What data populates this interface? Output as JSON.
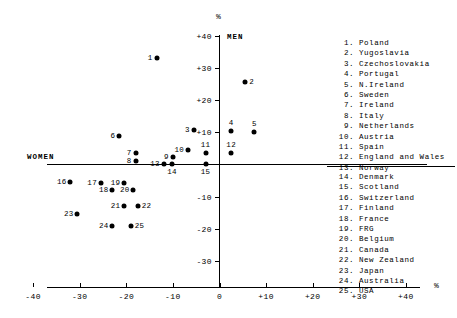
{
  "chart_data": {
    "type": "scatter",
    "title": "",
    "xlabel": "%",
    "ylabel": "%",
    "x_axis_label_right": "%",
    "y_axis_label_top": "%",
    "xlim": [
      -40,
      40
    ],
    "ylim": [
      -40,
      40
    ],
    "xticks": [
      "-40",
      "-30",
      "-20",
      "-10",
      "0",
      "+10",
      "+20",
      "+30",
      "+40"
    ],
    "xtick_values": [
      -40,
      -30,
      -20,
      -10,
      0,
      10,
      20,
      30,
      40
    ],
    "yticks": [
      "+40",
      "+30",
      "+20",
      "+10",
      "-10",
      "-20",
      "-30"
    ],
    "ytick_values": [
      40,
      30,
      20,
      10,
      -10,
      -20,
      -30
    ],
    "grid": false,
    "quadrant_labels": {
      "upper": "MEN",
      "left": "WOMEN"
    },
    "points": [
      {
        "id": "1",
        "label": "1",
        "name": "Poland",
        "x": -13.5,
        "y": 33.0,
        "label_pos": "left"
      },
      {
        "id": "2",
        "label": "2",
        "name": "Yugoslavia",
        "x": 5.5,
        "y": 25.5,
        "label_pos": "right"
      },
      {
        "id": "3",
        "label": "3",
        "name": "Czechoslovakia",
        "x": -5.5,
        "y": 10.8,
        "label_pos": "left"
      },
      {
        "id": "4",
        "label": "4",
        "name": "Portugal",
        "x": 2.5,
        "y": 10.3,
        "label_pos": "top"
      },
      {
        "id": "5",
        "label": "5",
        "name": "N.Ireland",
        "x": 7.5,
        "y": 10.0,
        "label_pos": "top"
      },
      {
        "id": "6",
        "label": "6",
        "name": "Sweden",
        "x": -21.5,
        "y": 9.0,
        "label_pos": "left"
      },
      {
        "id": "7",
        "label": "7",
        "name": "Ireland",
        "x": -18.0,
        "y": 3.5,
        "label_pos": "left"
      },
      {
        "id": "8",
        "label": "8",
        "name": "Italy",
        "x": -18.0,
        "y": 1.2,
        "label_pos": "left"
      },
      {
        "id": "9",
        "label": "9",
        "name": "Netherlands",
        "x": -10.0,
        "y": 2.3,
        "label_pos": "left"
      },
      {
        "id": "10",
        "label": "10",
        "name": "Austria",
        "x": -6.8,
        "y": 4.5,
        "label_pos": "left"
      },
      {
        "id": "11",
        "label": "11",
        "name": "Spain",
        "x": -3.0,
        "y": 3.5,
        "label_pos": "top"
      },
      {
        "id": "12",
        "label": "12",
        "name": "England and Wales",
        "x": 2.5,
        "y": 3.5,
        "label_pos": "top"
      },
      {
        "id": "13",
        "label": "13",
        "name": "Norway",
        "x": -12.0,
        "y": 0.3,
        "label_pos": "left"
      },
      {
        "id": "14",
        "label": "14",
        "name": "Denmark",
        "x": -10.2,
        "y": 0.3,
        "label_pos": "bottom"
      },
      {
        "id": "15",
        "label": "15",
        "name": "Scotland",
        "x": -3.0,
        "y": 0.3,
        "label_pos": "bottom"
      },
      {
        "id": "16",
        "label": "16",
        "name": "Switzerland",
        "x": -32.0,
        "y": -5.5,
        "label_pos": "left"
      },
      {
        "id": "17",
        "label": "17",
        "name": "Finland",
        "x": -25.5,
        "y": -5.6,
        "label_pos": "left"
      },
      {
        "id": "18",
        "label": "18",
        "name": "France",
        "x": -23.0,
        "y": -7.8,
        "label_pos": "left"
      },
      {
        "id": "19",
        "label": "19",
        "name": "FRG",
        "x": -20.5,
        "y": -5.6,
        "label_pos": "left"
      },
      {
        "id": "20",
        "label": "20",
        "name": "Belgium",
        "x": -18.5,
        "y": -8.0,
        "label_pos": "left"
      },
      {
        "id": "21",
        "label": "21",
        "name": "Canada",
        "x": -20.5,
        "y": -12.8,
        "label_pos": "left"
      },
      {
        "id": "22",
        "label": "22",
        "name": "New Zealand",
        "x": -17.5,
        "y": -12.8,
        "label_pos": "right"
      },
      {
        "id": "23",
        "label": "23",
        "name": "Japan",
        "x": -30.5,
        "y": -15.3,
        "label_pos": "left"
      },
      {
        "id": "24",
        "label": "24",
        "name": "Australia",
        "x": -23.0,
        "y": -19.0,
        "label_pos": "left"
      },
      {
        "id": "25",
        "label": "25",
        "name": "USA",
        "x": -19.0,
        "y": -19.0,
        "label_pos": "right"
      }
    ],
    "legend_top": [
      {
        "num": "1.",
        "name": "Poland"
      },
      {
        "num": "2.",
        "name": "Yugoslavia"
      },
      {
        "num": "3.",
        "name": "Czechoslovakia"
      },
      {
        "num": "4.",
        "name": "Portugal"
      },
      {
        "num": "5.",
        "name": "N.Ireland"
      },
      {
        "num": "6.",
        "name": "Sweden"
      },
      {
        "num": "7.",
        "name": "Ireland"
      },
      {
        "num": "8.",
        "name": "Italy"
      },
      {
        "num": "9.",
        "name": "Netherlands"
      },
      {
        "num": "10.",
        "name": "Austria"
      },
      {
        "num": "11.",
        "name": "Spain"
      },
      {
        "num": "12.",
        "name": "England and Wales"
      },
      {
        "num": "13.",
        "name": "Norway"
      }
    ],
    "legend_bottom": [
      {
        "num": "14.",
        "name": "Denmark"
      },
      {
        "num": "15.",
        "name": "Scotland"
      },
      {
        "num": "16.",
        "name": "Switzerland"
      },
      {
        "num": "17.",
        "name": "Finland"
      },
      {
        "num": "18.",
        "name": "France"
      },
      {
        "num": "19.",
        "name": "FRG"
      },
      {
        "num": "20.",
        "name": "Belgium"
      },
      {
        "num": "21.",
        "name": "Canada"
      },
      {
        "num": "22.",
        "name": "New Zealand"
      },
      {
        "num": "23.",
        "name": "Japan"
      },
      {
        "num": "24.",
        "name": "Australia"
      },
      {
        "num": "25.",
        "name": "USA"
      }
    ]
  },
  "colors": {
    "axis": "#000000",
    "marker": "#000000",
    "background": "#ffffff"
  }
}
